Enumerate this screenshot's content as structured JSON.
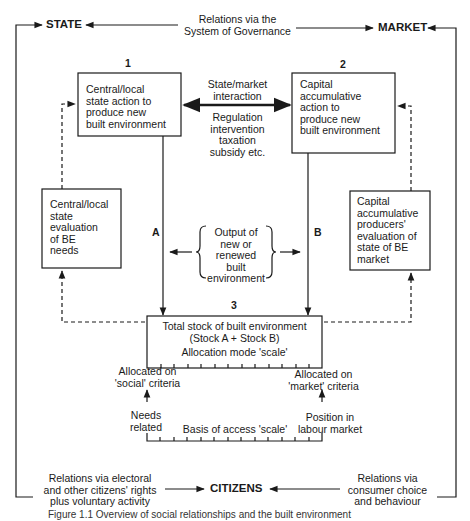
{
  "diagram": {
    "nodes": {
      "state": "STATE",
      "market": "MARKET",
      "citizens": "CITIZENS"
    },
    "governance_relation": "Relations via the\nSystem of Governance",
    "box1": {
      "number": "1",
      "text": "Central/local\nstate action to\nproduce new\nbuilt environment"
    },
    "box2": {
      "number": "2",
      "text": "Capital\naccumulative\naction to\nproduce new\nbuilt environment"
    },
    "interaction": {
      "label": "State/market\ninteraction",
      "detail": "Regulation\nintervention\ntaxation\nsubsidy etc."
    },
    "state_evaluation": "Central/local\nstate\nevaluation\nof BE\nneeds",
    "market_evaluation": "Capital\naccumulative\nproducers'\nevaluation of\nstate of BE\nmarket",
    "flow_a": "A",
    "flow_b": "B",
    "output": "Output of\nnew or\nrenewed\nbuilt\nenvironment",
    "box3": {
      "number": "3",
      "title": "Total stock of built environment\n(Stock A + Stock B)",
      "scale_label": "Allocation mode 'scale'"
    },
    "allocation": {
      "social": "Allocated on\n'social' criteria",
      "market": "Allocated on\n'market' criteria"
    },
    "access": {
      "needs": "Needs\nrelated",
      "labour": "Position in\nlabour market",
      "scale_label": "Basis of access 'scale'"
    },
    "citizen_relations": {
      "electoral": "Relations via electoral\nand other citizens' rights\nplus voluntary activity",
      "consumer": "Relations via\nconsumer choice\nand behaviour"
    },
    "caption": "Figure 1.1 Overview of social relationships and the built environment"
  }
}
